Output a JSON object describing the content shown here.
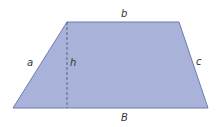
{
  "diagram": {
    "shape": "trapezoid",
    "colors": {
      "fill": "#A9B3D9",
      "stroke": "#6F7BB0",
      "dash": "#4A4F6A",
      "text": "#333333"
    },
    "labels": {
      "top_base": "b",
      "bottom_base": "B",
      "left_side": "a",
      "right_side": "c",
      "height": "h"
    }
  }
}
